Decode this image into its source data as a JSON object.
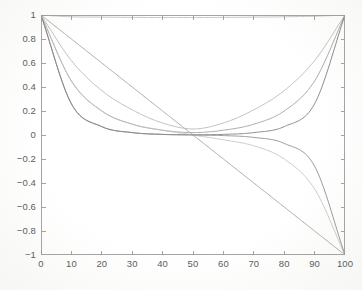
{
  "chart_data": {
    "type": "line",
    "title": "",
    "subtitle": "",
    "xlabel": "",
    "ylabel": "",
    "xlim": [
      0,
      100
    ],
    "ylim": [
      -1,
      1
    ],
    "xticks": [
      0,
      10,
      20,
      30,
      40,
      50,
      60,
      70,
      80,
      90,
      100
    ],
    "yticks": [
      1,
      0.8,
      0.6,
      0.4,
      0.2,
      0,
      -0.2,
      -0.4,
      -0.6,
      -0.8,
      -1
    ],
    "xtick_labels": [
      "0",
      "10",
      "20",
      "30",
      "40",
      "50",
      "60",
      "70",
      "80",
      "90",
      "100"
    ],
    "ytick_labels": [
      "1",
      "0.8",
      "0.6",
      "0.4",
      "0.2",
      "0",
      "−0.2",
      "−0.4",
      "−0.6",
      "−0.8",
      "−1"
    ],
    "grid": false,
    "legend": false,
    "legend_position": "none",
    "frame": "box",
    "tick_direction": "in",
    "background_color": "#fefefe",
    "axis_color": "#9a9a9a",
    "series": [
      {
        "name": "flat-top",
        "color": "#b9b9b9",
        "comment": "near-constant line just below y=1, from (0,1) to (100,1)",
        "x": [
          0,
          10,
          20,
          30,
          40,
          50,
          60,
          70,
          80,
          90,
          100
        ],
        "values": [
          1.0,
          0.985,
          0.982,
          0.98,
          0.979,
          0.979,
          0.98,
          0.982,
          0.985,
          0.99,
          1.0
        ]
      },
      {
        "name": "straight-diagonal",
        "color": "#9e9e9e",
        "comment": "straight line from (0,1) to (100,-1)",
        "x": [
          0,
          10,
          20,
          30,
          40,
          50,
          60,
          70,
          80,
          90,
          100
        ],
        "values": [
          1.0,
          0.8,
          0.6,
          0.4,
          0.2,
          0.0,
          -0.2,
          -0.4,
          -0.6,
          -0.8,
          -1.0
        ]
      },
      {
        "name": "u-shallow",
        "color": "#b4b4b4",
        "comment": "gentle U, min ~0.05 at x=50, returns to 1",
        "x": [
          0,
          10,
          20,
          30,
          40,
          50,
          60,
          70,
          80,
          90,
          100
        ],
        "values": [
          1.0,
          0.62,
          0.37,
          0.21,
          0.1,
          0.05,
          0.1,
          0.21,
          0.37,
          0.62,
          1.0
        ]
      },
      {
        "name": "u-medium",
        "color": "#9b9b9b",
        "comment": "U shape, flatter bottom, min ~0.02",
        "x": [
          0,
          10,
          20,
          30,
          40,
          50,
          60,
          70,
          80,
          90,
          100
        ],
        "values": [
          1.0,
          0.45,
          0.2,
          0.09,
          0.04,
          0.02,
          0.04,
          0.09,
          0.2,
          0.45,
          1.0
        ]
      },
      {
        "name": "u-steep",
        "color": "#777777",
        "comment": "steep U with wide flat bottom near 0",
        "x": [
          0,
          10,
          20,
          30,
          40,
          50,
          60,
          70,
          80,
          90,
          100
        ],
        "values": [
          1.0,
          0.26,
          0.07,
          0.02,
          0.005,
          0.002,
          0.005,
          0.02,
          0.07,
          0.26,
          1.0
        ]
      },
      {
        "name": "s-shallow",
        "color": "#c0c0c0",
        "comment": "decays to ~0 then falls to -1 at x=100",
        "x": [
          0,
          10,
          20,
          30,
          40,
          50,
          60,
          70,
          80,
          90,
          100
        ],
        "values": [
          1.0,
          0.45,
          0.2,
          0.09,
          0.04,
          0.0,
          -0.04,
          -0.09,
          -0.2,
          -0.45,
          -1.0
        ]
      },
      {
        "name": "s-steep",
        "color": "#888888",
        "comment": "fast decay to 0, long flat, then plunges to -1",
        "x": [
          0,
          10,
          20,
          30,
          40,
          50,
          60,
          70,
          80,
          90,
          100
        ],
        "values": [
          1.0,
          0.26,
          0.07,
          0.02,
          0.005,
          0.0,
          -0.005,
          -0.02,
          -0.07,
          -0.26,
          -1.0
        ]
      }
    ]
  }
}
